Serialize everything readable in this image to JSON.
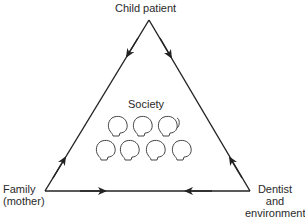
{
  "diagram": {
    "type": "triangle-relationship",
    "nodes": {
      "top": "Child patient",
      "bottom_left_line1": "Family",
      "bottom_left_line2": "(mother)",
      "bottom_right_line1": "Dentist",
      "bottom_right_line2": "and",
      "bottom_right_line3": "environment"
    },
    "center": {
      "label": "Society",
      "icon": "group-of-heads-icon",
      "head_count": 7
    },
    "edges": [
      {
        "from": "Child patient",
        "to": "Family (mother)",
        "direction": "child-to-family"
      },
      {
        "from": "Family (mother)",
        "to": "Child patient",
        "direction": "family-to-child"
      },
      {
        "from": "Child patient",
        "to": "Dentist and environment",
        "direction": "child-to-dentist"
      },
      {
        "from": "Dentist and environment",
        "to": "Child patient",
        "direction": "dentist-to-child"
      },
      {
        "from": "Family (mother)",
        "to": "Dentist and environment",
        "direction": "family-to-dentist"
      },
      {
        "from": "Dentist and environment",
        "to": "Family (mother)",
        "direction": "dentist-to-family"
      }
    ],
    "colors": {
      "line": "#222222",
      "background": "#ffffff"
    }
  }
}
